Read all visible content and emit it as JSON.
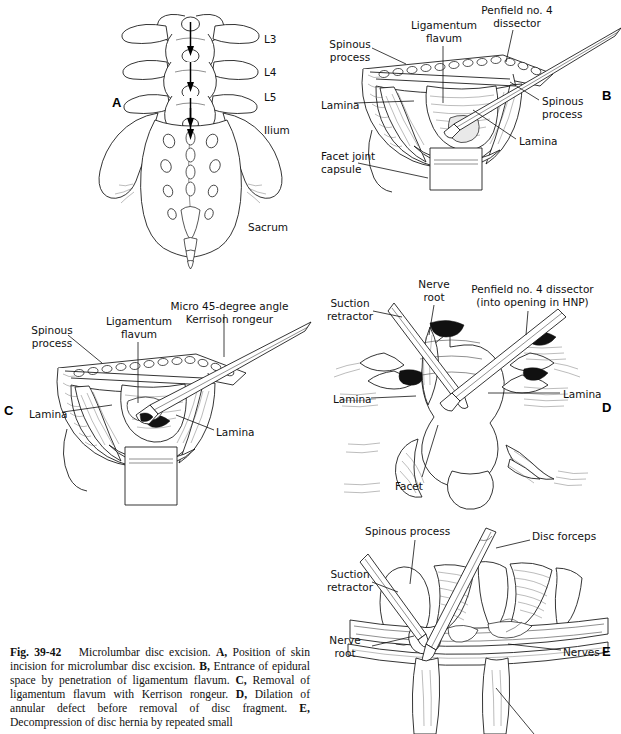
{
  "figure": {
    "number": "Fig. 39-42",
    "title": "Microlumbar disc excision.",
    "caption_segments": [
      {
        "bold": "Fig. 39-42",
        "text": ""
      },
      {
        "bold": "",
        "text": "Microlumbar disc excision. "
      },
      {
        "bold": "A,",
        "text": " Position of skin incision for microlumbar disc excision. "
      },
      {
        "bold": "B,",
        "text": " Entrance of epidural space by penetration of ligamentum flavum. "
      },
      {
        "bold": "C,",
        "text": " Removal of ligamentum flavum with Kerrison rongeur. "
      },
      {
        "bold": "D,",
        "text": " Dilation of annular defect before removal of disc fragment. "
      },
      {
        "bold": "E,",
        "text": " Decompression of disc hernia by repeated small"
      }
    ],
    "caption_plain": "Fig. 39-42   Microlumbar disc excision. A, Position of skin incision for microlumbar disc excision. B, Entrance of epidural space by penetration of ligamentum flavum. C, Removal of ligamentum flavum with Kerrison rongeur. D, Dilation of annular defect before removal of disc fragment. E, Decompression of disc hernia by repeated small"
  },
  "panels": {
    "a": {
      "letter": "A",
      "subject": "lumbar-spine-sacrum-posterior-view",
      "labels": {
        "l3": "L3",
        "l4": "L4",
        "l5": "L5",
        "ilium": "Ilium",
        "sacrum": "Sacrum"
      }
    },
    "b": {
      "letter": "B",
      "subject": "surgical-exposure-ligamentum-flavum",
      "labels": {
        "spinous_process_left": "Spinous\nprocess",
        "ligamentum_flavum": "Ligamentum\nflavum",
        "penfield": "Penfield no. 4\ndissector",
        "lamina_left": "Lamina",
        "spinous_process_right": "Spinous\nprocess",
        "lamina_right": "Lamina",
        "facet_joint_capsule": "Facet joint\ncapsule"
      }
    },
    "c": {
      "letter": "C",
      "subject": "kerrison-rongeur-removal-ligamentum-flavum",
      "labels": {
        "spinous_process": "Spinous\nprocess",
        "ligamentum_flavum": "Ligamentum\nflavum",
        "kerrison": "Micro 45-degree angle\nKerrison rongeur",
        "lamina_left": "Lamina",
        "lamina_right": "Lamina"
      }
    },
    "d": {
      "letter": "D",
      "subject": "annular-defect-dilation",
      "labels": {
        "suction_retractor": "Suction\nretractor",
        "nerve_root": "Nerve\nroot",
        "penfield": "Penfield no. 4 dissector\n(into opening in HNP)",
        "lamina_left": "Lamina",
        "lamina_right": "Lamina",
        "facet": "Facet"
      }
    },
    "e": {
      "letter": "E",
      "subject": "disc-forceps-decompression",
      "labels": {
        "spinous_process": "Spinous process",
        "disc_forceps": "Disc forceps",
        "suction_retractor": "Suction\nretractor",
        "nerve_root": "Nerve\nroot",
        "nerves": "Nerves"
      }
    }
  },
  "colors": {
    "background": "#ffffff",
    "ink": "#111111",
    "shade": "#e9e9e9"
  }
}
